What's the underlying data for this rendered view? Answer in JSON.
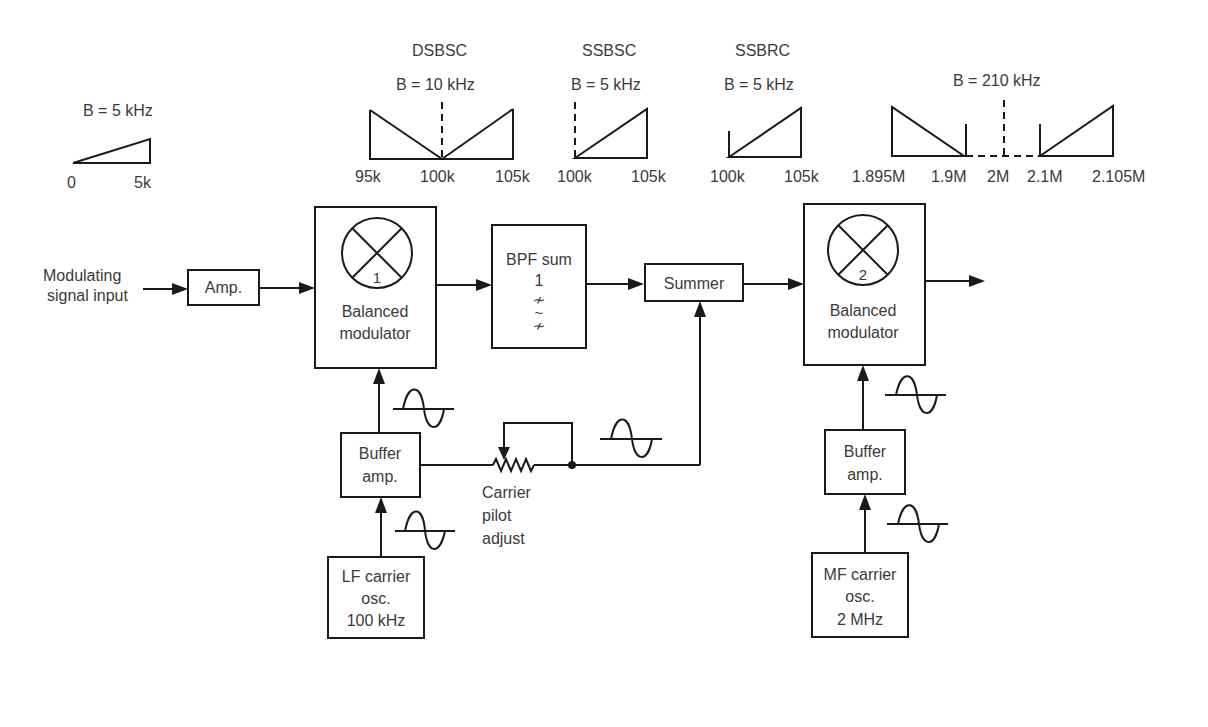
{
  "spectra": {
    "baseband": {
      "bandwidth": "B = 5 kHz",
      "ticks": [
        "0",
        "5k"
      ]
    },
    "dsbsc": {
      "title": "DSBSC",
      "bandwidth": "B = 10 kHz",
      "ticks": [
        "95k",
        "100k",
        "105k"
      ]
    },
    "ssbsc": {
      "title": "SSBSC",
      "bandwidth": "B = 5 kHz",
      "ticks": [
        "100k",
        "105k"
      ]
    },
    "ssbrc": {
      "title": "SSBRC",
      "bandwidth": "B = 5 kHz",
      "ticks": [
        "100k",
        "105k"
      ]
    },
    "output": {
      "bandwidth": "B = 210 kHz",
      "ticks": [
        "1.895M",
        "1.9M",
        "2M",
        "2.1M",
        "2.105M"
      ]
    }
  },
  "blocks": {
    "input_label": [
      "Modulating",
      "signal input"
    ],
    "amp": "Amp.",
    "balanced_modulator_1": {
      "number": "1",
      "label": [
        "Balanced",
        "modulator"
      ]
    },
    "bpf": {
      "label": [
        "BPF sum",
        "1"
      ],
      "symbol": [
        "≁",
        "~",
        "≁"
      ]
    },
    "summer": "Summer",
    "balanced_modulator_2": {
      "number": "2",
      "label": [
        "Balanced",
        "modulator"
      ]
    },
    "buffer_amp_1": [
      "Buffer",
      "amp."
    ],
    "buffer_amp_2": [
      "Buffer",
      "amp."
    ],
    "lf_osc": [
      "LF carrier",
      "osc.",
      "100 kHz"
    ],
    "mf_osc": [
      "MF carrier",
      "osc.",
      "2 MHz"
    ],
    "pilot_adjust": [
      "Carrier",
      "pilot",
      "adjust"
    ]
  }
}
